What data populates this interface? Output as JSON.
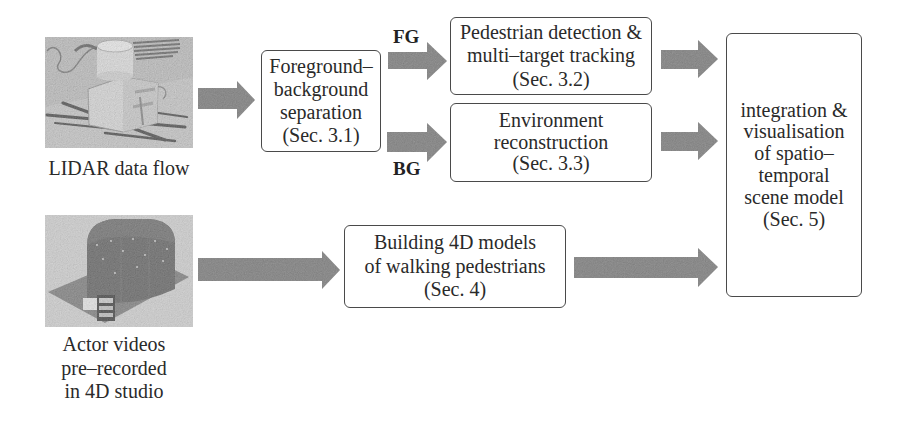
{
  "diagram": {
    "inputs": {
      "lidar": {
        "image": "lidar-sensor-scene",
        "caption_lines": [
          "LIDAR data flow"
        ]
      },
      "actor": {
        "image": "4d-studio-dome",
        "caption_lines": [
          "Actor videos",
          "pre–recorded",
          "in 4D studio"
        ]
      }
    },
    "boxes": {
      "fg_bg_separation": {
        "lines": [
          "Foreground–",
          "background",
          "separation",
          "(Sec. 3.1)"
        ]
      },
      "pedestrian_detection": {
        "lines": [
          "Pedestrian detection &",
          "multi–target tracking",
          "(Sec. 3.2)"
        ]
      },
      "environment_reconstruction": {
        "lines": [
          "Environment",
          "reconstruction",
          "(Sec. 3.3)"
        ]
      },
      "building_4d_models": {
        "lines": [
          "Building 4D models",
          "of walking pedestrians",
          "(Sec. 4)"
        ]
      },
      "integration": {
        "lines": [
          "integration &",
          "visualisation",
          "of spatio–",
          "temporal",
          "scene model",
          "(Sec. 5)"
        ]
      }
    },
    "edge_labels": {
      "fg": "FG",
      "bg": "BG"
    },
    "edges": [
      {
        "from": "lidar",
        "to": "fg_bg_separation"
      },
      {
        "from": "fg_bg_separation",
        "to": "pedestrian_detection",
        "label": "FG"
      },
      {
        "from": "fg_bg_separation",
        "to": "environment_reconstruction",
        "label": "BG"
      },
      {
        "from": "pedestrian_detection",
        "to": "integration"
      },
      {
        "from": "environment_reconstruction",
        "to": "integration"
      },
      {
        "from": "actor",
        "to": "building_4d_models"
      },
      {
        "from": "building_4d_models",
        "to": "integration"
      }
    ],
    "colors": {
      "arrow": "#7d7d7d",
      "box_border": "#4a4a4a",
      "text": "#2a2a2a"
    }
  }
}
